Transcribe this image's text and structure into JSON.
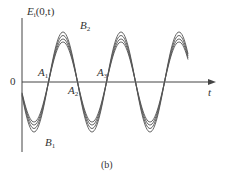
{
  "figure": {
    "caption": "(b)",
    "y_axis_label": {
      "base": "E",
      "sub": "i",
      "args": "(0,t)"
    },
    "x_axis_label": "t",
    "origin_label": "0",
    "annotations": [
      {
        "base": "A",
        "sub": "1"
      },
      {
        "base": "A",
        "sub": "2"
      },
      {
        "base": "A",
        "sub": "3"
      },
      {
        "base": "B",
        "sub": "1"
      },
      {
        "base": "B",
        "sub": "2"
      }
    ],
    "colors": {
      "curve": "#555555",
      "axis": "#444444",
      "text": "#333333"
    }
  },
  "chart_data": {
    "type": "line",
    "title": "",
    "xlabel": "t",
    "ylabel": "E_i(0,t)",
    "series": [
      {
        "name": "curve-1",
        "amplitude": 1.0
      },
      {
        "name": "curve-2",
        "amplitude": 0.93
      },
      {
        "name": "curve-3",
        "amplitude": 0.86
      },
      {
        "name": "curve-4",
        "amplitude": 0.8
      }
    ],
    "periods_shown": 2.7,
    "grid": false,
    "legend": "none"
  }
}
